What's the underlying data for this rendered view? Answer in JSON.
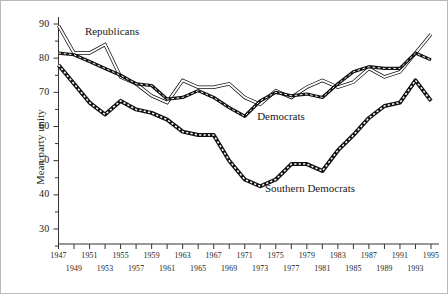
{
  "chart_data": {
    "type": "line",
    "title": "",
    "xlabel": "",
    "ylabel": "Mean party unity",
    "xlim": [
      1947,
      1995
    ],
    "ylim": [
      25,
      92
    ],
    "grid": false,
    "legend_position": "inline-annotations",
    "y_ticks_major": [
      30,
      40,
      50,
      60,
      70,
      80,
      90
    ],
    "y_ticks_minor": [
      25,
      35,
      45,
      55,
      65,
      75,
      85
    ],
    "x_ticks_upper": [
      1947,
      1951,
      1955,
      1959,
      1963,
      1967,
      1971,
      1975,
      1979,
      1983,
      1987,
      1991,
      1995
    ],
    "x_ticks_lower": [
      1949,
      1953,
      1957,
      1961,
      1965,
      1969,
      1973,
      1977,
      1981,
      1985,
      1989,
      1993
    ],
    "x": [
      1947,
      1949,
      1951,
      1953,
      1955,
      1957,
      1959,
      1961,
      1963,
      1965,
      1967,
      1969,
      1971,
      1973,
      1975,
      1977,
      1979,
      1981,
      1983,
      1985,
      1987,
      1989,
      1991,
      1993,
      1995
    ],
    "series": [
      {
        "name": "Republicans",
        "style": "double-line",
        "color": "#111111",
        "values": [
          89.5,
          81.5,
          81.5,
          84.0,
          74.5,
          72.5,
          69.0,
          67.0,
          73.5,
          71.5,
          71.5,
          72.5,
          68.5,
          66.5,
          70.5,
          68.5,
          71.5,
          73.5,
          71.5,
          73.0,
          77.0,
          74.5,
          76.0,
          81.5,
          87.0
        ]
      },
      {
        "name": "Democrats",
        "style": "dashed-thick",
        "color": "#111111",
        "values": [
          81.5,
          81.0,
          79.0,
          77.0,
          75.0,
          72.5,
          72.0,
          68.0,
          68.5,
          70.5,
          68.5,
          65.5,
          63.0,
          67.5,
          70.0,
          69.0,
          69.5,
          68.5,
          72.5,
          76.0,
          77.5,
          77.0,
          77.0,
          81.5,
          79.5
        ]
      },
      {
        "name": "Southern Democrats",
        "style": "dotted-square",
        "color": "#111111",
        "values": [
          78.0,
          72.5,
          67.0,
          63.5,
          67.5,
          65.0,
          64.0,
          62.0,
          58.5,
          57.5,
          57.5,
          50.0,
          44.5,
          42.5,
          44.5,
          49.0,
          49.0,
          47.0,
          53.0,
          57.5,
          62.5,
          66.0,
          67.0,
          73.5,
          67.5
        ]
      }
    ],
    "annotations": [
      {
        "text": "Republicans",
        "x": 1950.4,
        "y": 87.5
      },
      {
        "text": "Democrats",
        "x": 1972.6,
        "y": 62.5
      },
      {
        "text": "Southern Democrats",
        "x": 1973.6,
        "y": 41.5
      }
    ]
  }
}
